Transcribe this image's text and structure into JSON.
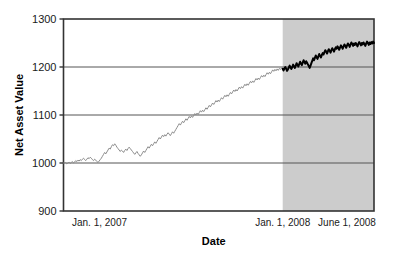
{
  "chart_data": {
    "type": "line",
    "title": "",
    "xlabel": "Date",
    "ylabel": "Net Asset Value",
    "ylim": [
      900,
      1300
    ],
    "yticks": [
      900,
      1000,
      1100,
      1200,
      1300
    ],
    "ytick_labels": [
      "900",
      "1000",
      "1100",
      "1200",
      "1300"
    ],
    "xtick_labels": [
      "Jan. 1, 2007",
      "Jan. 1, 2008",
      "June 1, 2008"
    ],
    "xtick_positions": [
      0,
      365,
      517
    ],
    "xlim": [
      0,
      517
    ],
    "grid": "horizontal",
    "legend": "none",
    "shaded_region": {
      "label": "Jan. 1, 2008 to June 1, 2008",
      "x_start": 365,
      "x_end": 517,
      "color": "#cccccc"
    },
    "series": [
      {
        "name": "Net Asset Value (historical)",
        "color": "#8c8c8c",
        "line_width": 1,
        "x_range": [
          0,
          365
        ],
        "values": [
          1000,
          999,
          1001,
          998,
          1000,
          1002,
          999,
          1001,
          1003,
          1000,
          1002,
          1005,
          1003,
          1006,
          1004,
          1007,
          1005,
          1008,
          1010,
          1007,
          1005,
          1008,
          1011,
          1009,
          1012,
          1010,
          1007,
          1005,
          1008,
          1006,
          1003,
          1001,
          1004,
          1007,
          1010,
          1014,
          1018,
          1022,
          1019,
          1023,
          1027,
          1031,
          1029,
          1034,
          1038,
          1036,
          1040,
          1037,
          1033,
          1030,
          1027,
          1024,
          1027,
          1025,
          1022,
          1026,
          1029,
          1026,
          1030,
          1033,
          1030,
          1027,
          1024,
          1021,
          1018,
          1021,
          1024,
          1020,
          1017,
          1014,
          1017,
          1021,
          1025,
          1022,
          1026,
          1030,
          1034,
          1031,
          1035,
          1039,
          1036,
          1040,
          1044,
          1041,
          1045,
          1049,
          1053,
          1050,
          1054,
          1058,
          1055,
          1059,
          1056,
          1060,
          1063,
          1060,
          1057,
          1061,
          1065,
          1062,
          1066,
          1070,
          1074,
          1078,
          1082,
          1079,
          1083,
          1087,
          1084,
          1088,
          1092,
          1089,
          1093,
          1097,
          1094,
          1098,
          1095,
          1099,
          1103,
          1100,
          1104,
          1101,
          1105,
          1109,
          1106,
          1110,
          1107,
          1111,
          1115,
          1112,
          1116,
          1120,
          1117,
          1121,
          1125,
          1122,
          1126,
          1130,
          1127,
          1131,
          1128,
          1132,
          1136,
          1133,
          1137,
          1141,
          1138,
          1142,
          1139,
          1143,
          1147,
          1144,
          1148,
          1152,
          1149,
          1153,
          1150,
          1154,
          1158,
          1155,
          1159,
          1156,
          1160,
          1164,
          1161,
          1165,
          1162,
          1166,
          1170,
          1167,
          1171,
          1168,
          1172,
          1176,
          1173,
          1177,
          1174,
          1178,
          1182,
          1179,
          1183,
          1180,
          1184,
          1188,
          1185,
          1189,
          1186,
          1190,
          1194,
          1191,
          1195,
          1192,
          1196,
          1193,
          1197,
          1195,
          1198,
          1196
        ]
      },
      {
        "name": "Net Asset Value (projection period)",
        "color": "#000000",
        "line_width": 2,
        "x_range": [
          365,
          517
        ],
        "values": [
          1196,
          1193,
          1197,
          1200,
          1196,
          1192,
          1195,
          1199,
          1203,
          1199,
          1196,
          1200,
          1205,
          1201,
          1198,
          1203,
          1208,
          1204,
          1201,
          1206,
          1211,
          1207,
          1204,
          1209,
          1214,
          1210,
          1207,
          1212,
          1209,
          1205,
          1202,
          1198,
          1203,
          1208,
          1213,
          1218,
          1214,
          1219,
          1224,
          1220,
          1217,
          1222,
          1227,
          1223,
          1220,
          1225,
          1229,
          1226,
          1231,
          1235,
          1232,
          1228,
          1233,
          1237,
          1234,
          1230,
          1235,
          1239,
          1236,
          1232,
          1237,
          1241,
          1238,
          1243,
          1240,
          1236,
          1241,
          1245,
          1242,
          1238,
          1243,
          1247,
          1244,
          1240,
          1245,
          1249,
          1246,
          1242,
          1247,
          1251,
          1248,
          1244,
          1249,
          1246,
          1250,
          1247,
          1243,
          1248,
          1252,
          1249,
          1245,
          1250,
          1247,
          1251,
          1248,
          1244,
          1249,
          1253,
          1250,
          1246,
          1251,
          1248,
          1252,
          1249,
          1253,
          1250
        ]
      }
    ]
  },
  "axes": {
    "y_title": "Net Asset Value",
    "x_title": "Date"
  },
  "colors": {
    "frame": "#333333",
    "gridline": "#555555",
    "shade": "#cccccc",
    "line_historical": "#8c8c8c",
    "line_forecast": "#000000",
    "background": "#ffffff"
  }
}
